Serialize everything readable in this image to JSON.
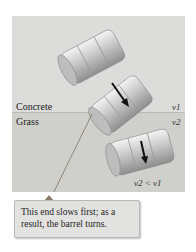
{
  "figure": {
    "surfaces": {
      "top_label": "Concrete",
      "bottom_label": "Grass"
    },
    "speeds": {
      "concrete_speed": "v1",
      "grass_speed": "v2",
      "relation": "v2 < v1"
    },
    "callout_text": "This end slows first; as a result, the barrel turns.",
    "colors": {
      "concrete": "#dcdcda",
      "grass": "#cfd0cc",
      "callout_bg": "#e2e2e0",
      "leader_line": "#8a7a6a"
    }
  }
}
